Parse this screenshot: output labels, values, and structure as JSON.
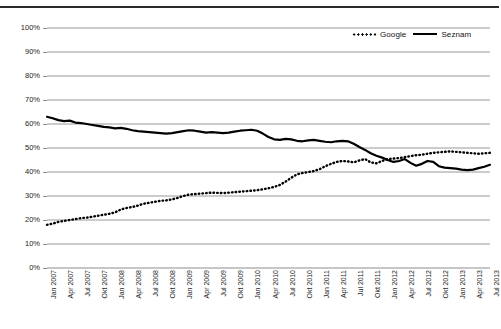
{
  "chart_data": {
    "type": "line",
    "title": "",
    "subtitle": "",
    "xlabel": "",
    "ylabel": "",
    "ylim": [
      0,
      100
    ],
    "ytick_labels": [
      "100%",
      "90%",
      "80%",
      "70%",
      "60%",
      "50%",
      "40%",
      "30%",
      "20%",
      "10%",
      "0%"
    ],
    "ytick_values": [
      100,
      90,
      80,
      70,
      60,
      50,
      40,
      30,
      20,
      10,
      0
    ],
    "grid": true,
    "legend_position": "top-right",
    "x_tick_labels": [
      "Jan 2007",
      "Apr 2007",
      "Jul 2007",
      "Okt 2007",
      "Jan 2008",
      "Apr 2008",
      "Jul 2008",
      "Okt 2008",
      "Jan 2009",
      "Apr 2009",
      "Jul 2009",
      "Okt 2009",
      "Jan 2010",
      "Apr 2010",
      "Jul 2010",
      "Okt 2010",
      "Jan 2011",
      "Apr 2011",
      "Jul 2011",
      "Okt 2011",
      "Jan 2012",
      "Apr 2012",
      "Jul 2012",
      "Okt 2012",
      "Jan 2013",
      "Apr 2013",
      "Jul 2013"
    ],
    "x_tick_index": [
      0,
      3,
      6,
      9,
      12,
      15,
      18,
      21,
      24,
      27,
      30,
      33,
      36,
      39,
      42,
      45,
      48,
      51,
      54,
      57,
      60,
      63,
      66,
      69,
      72,
      75,
      78
    ],
    "x_start": "Jan 2007",
    "x_end": "Jul 2013",
    "x_step": "monthly",
    "n_points": 79,
    "series": [
      {
        "name": "Google",
        "style": "dotted",
        "color": "#000000",
        "values": [
          18.0,
          18.5,
          19.2,
          19.6,
          20.0,
          20.4,
          20.8,
          21.0,
          21.4,
          21.8,
          22.2,
          22.6,
          23.2,
          24.4,
          25.0,
          25.4,
          26.0,
          26.8,
          27.2,
          27.6,
          28.0,
          28.2,
          28.6,
          29.2,
          30.0,
          30.6,
          30.8,
          31.0,
          31.2,
          31.4,
          31.3,
          31.2,
          31.4,
          31.6,
          31.8,
          32.0,
          32.2,
          32.4,
          32.8,
          33.2,
          33.8,
          34.6,
          36.0,
          37.6,
          39.0,
          39.6,
          40.0,
          40.4,
          41.2,
          42.4,
          43.4,
          44.2,
          44.6,
          44.4,
          44.0,
          44.8,
          45.4,
          44.0,
          43.6,
          44.6,
          45.4,
          45.6,
          45.8,
          46.2,
          46.6,
          47.0,
          47.2,
          47.6,
          48.0,
          48.2,
          48.4,
          48.6,
          48.4,
          48.2,
          48.0,
          47.8,
          47.6,
          47.8,
          48.0
        ]
      },
      {
        "name": "Seznam",
        "style": "solid",
        "color": "#000000",
        "values": [
          63.0,
          62.4,
          61.6,
          61.2,
          61.4,
          60.6,
          60.4,
          60.0,
          59.6,
          59.2,
          58.8,
          58.6,
          58.2,
          58.4,
          58.0,
          57.4,
          57.0,
          56.8,
          56.6,
          56.4,
          56.2,
          56.0,
          56.2,
          56.6,
          57.0,
          57.4,
          57.2,
          56.8,
          56.4,
          56.6,
          56.4,
          56.2,
          56.4,
          56.8,
          57.2,
          57.4,
          57.6,
          57.2,
          56.0,
          54.6,
          53.6,
          53.4,
          53.8,
          53.6,
          53.0,
          52.8,
          53.2,
          53.4,
          53.0,
          52.6,
          52.4,
          52.8,
          53.0,
          52.8,
          51.8,
          50.4,
          49.2,
          47.8,
          46.8,
          46.0,
          45.0,
          44.2,
          44.6,
          45.4,
          43.8,
          42.6,
          43.4,
          44.6,
          44.2,
          42.4,
          41.8,
          41.6,
          41.4,
          41.0,
          40.8,
          41.0,
          41.6,
          42.2,
          43.0
        ]
      }
    ]
  },
  "legend": {
    "entries": [
      {
        "label": "Google",
        "style": "dotted"
      },
      {
        "label": "Seznam",
        "style": "solid"
      }
    ]
  },
  "header": {
    "faint_text": ""
  }
}
